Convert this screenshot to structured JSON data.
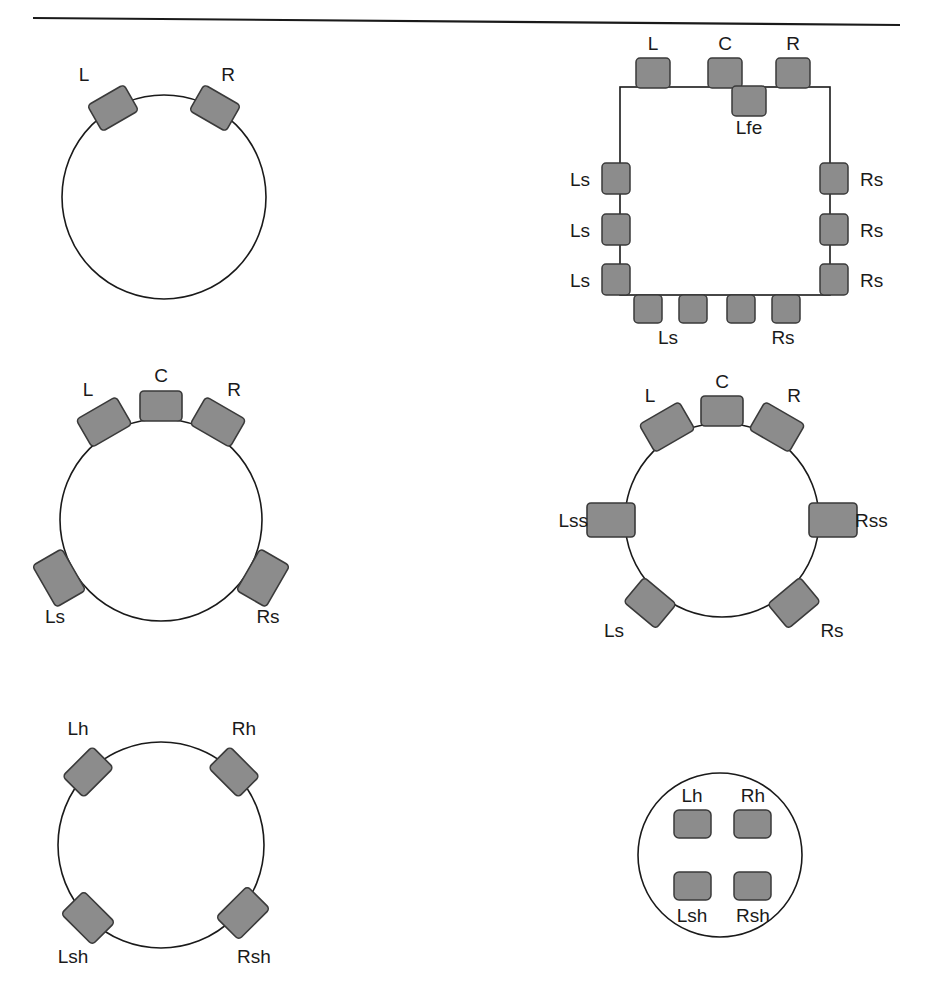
{
  "page": {
    "top_rule": true,
    "background_color": "#ffffff",
    "ink_color": "#1a1a1a",
    "speaker_fill": "#8c8c8c",
    "speaker_stroke": "#3a3a3a"
  },
  "figures": [
    {
      "id": "fig-2-0",
      "name": "two-channel-stereo",
      "shape": "circle",
      "center": [
        164,
        197
      ],
      "radius": 102,
      "speakers": [
        {
          "label": "L",
          "angle": -30,
          "placement": "outside",
          "label_pos": "above"
        },
        {
          "label": "R",
          "angle": 30,
          "placement": "outside",
          "label_pos": "above"
        }
      ]
    },
    {
      "id": "fig-square",
      "name": "large-room-square-layout",
      "shape": "square",
      "rect": [
        620,
        87,
        210,
        208
      ],
      "speakers": [
        {
          "label": "L",
          "edge": "top",
          "pos": 0.18,
          "label_pos": "above"
        },
        {
          "label": "C",
          "edge": "top",
          "pos": 0.5,
          "label_pos": "above"
        },
        {
          "label": "R",
          "edge": "top",
          "pos": 0.82,
          "label_pos": "above"
        },
        {
          "label": "Lfe",
          "edge": "top-inner",
          "pos": 0.62,
          "label_pos": "below"
        },
        {
          "label": "Ls",
          "edge": "left",
          "pos": 0.37,
          "label_pos": "left"
        },
        {
          "label": "Ls",
          "edge": "left",
          "pos": 0.62,
          "label_pos": "left"
        },
        {
          "label": "Ls",
          "edge": "left",
          "pos": 0.86,
          "label_pos": "left"
        },
        {
          "label": "Rs",
          "edge": "right",
          "pos": 0.37,
          "label_pos": "right"
        },
        {
          "label": "Rs",
          "edge": "right",
          "pos": 0.62,
          "label_pos": "right"
        },
        {
          "label": "Rs",
          "edge": "right",
          "pos": 0.86,
          "label_pos": "right"
        },
        {
          "label": "Ls",
          "edge": "bottom",
          "pos": 0.17,
          "label_pos": "none"
        },
        {
          "label": "Ls",
          "edge": "bottom",
          "pos": 0.39,
          "label_pos": "below-pair"
        },
        {
          "label": "Rs",
          "edge": "bottom",
          "pos": 0.61,
          "label_pos": "none"
        },
        {
          "label": "Rs",
          "edge": "bottom",
          "pos": 0.83,
          "label_pos": "below-pair"
        }
      ],
      "bottom_labels": [
        {
          "text": "Ls",
          "x": 668,
          "y": 340
        },
        {
          "text": "Rs",
          "x": 783,
          "y": 340
        }
      ]
    },
    {
      "id": "fig-5-1",
      "name": "five-channel-surround",
      "shape": "circle",
      "center": [
        161,
        520
      ],
      "radius": 101,
      "speakers": [
        {
          "label": "C",
          "angle": 0,
          "placement": "outside",
          "label_pos": "above"
        },
        {
          "label": "L",
          "angle": -30,
          "placement": "outside",
          "label_pos": "above"
        },
        {
          "label": "R",
          "angle": 30,
          "placement": "outside",
          "label_pos": "above"
        },
        {
          "label": "Ls",
          "angle": -120,
          "placement": "outside",
          "label_pos": "below"
        },
        {
          "label": "Rs",
          "angle": 120,
          "placement": "outside",
          "label_pos": "below"
        }
      ]
    },
    {
      "id": "fig-7-1",
      "name": "seven-channel-surround",
      "shape": "circle",
      "center": [
        722,
        520
      ],
      "radius": 97,
      "speakers": [
        {
          "label": "C",
          "angle": 0,
          "placement": "outside",
          "label_pos": "above"
        },
        {
          "label": "L",
          "angle": -30,
          "placement": "outside",
          "label_pos": "above"
        },
        {
          "label": "R",
          "angle": 30,
          "placement": "outside",
          "label_pos": "above"
        },
        {
          "label": "Lss",
          "angle": -90,
          "placement": "outside",
          "label_pos": "left"
        },
        {
          "label": "Rss",
          "angle": 90,
          "placement": "outside",
          "label_pos": "right"
        },
        {
          "label": "Ls",
          "angle": -140,
          "placement": "outside",
          "label_pos": "below"
        },
        {
          "label": "Rs",
          "angle": 140,
          "placement": "outside",
          "label_pos": "below"
        }
      ]
    },
    {
      "id": "fig-height",
      "name": "four-channel-height-layer",
      "shape": "circle",
      "center": [
        161,
        845
      ],
      "radius": 103,
      "speakers": [
        {
          "label": "Lh",
          "angle": -45,
          "placement": "outside",
          "label_pos": "above"
        },
        {
          "label": "Rh",
          "angle": 45,
          "placement": "outside",
          "label_pos": "above"
        },
        {
          "label": "Lsh",
          "angle": -135,
          "placement": "outside",
          "label_pos": "below"
        },
        {
          "label": "Rsh",
          "angle": 135,
          "placement": "outside",
          "label_pos": "below"
        }
      ]
    },
    {
      "id": "fig-overhead",
      "name": "four-channel-overhead-layer",
      "shape": "circle",
      "center": [
        720,
        855
      ],
      "radius": 82,
      "inner_speakers": [
        {
          "label": "Lh",
          "x": 692,
          "y": 824,
          "label_pos": "above"
        },
        {
          "label": "Rh",
          "x": 752,
          "y": 824,
          "label_pos": "above"
        },
        {
          "label": "Lsh",
          "x": 692,
          "y": 884,
          "label_pos": "below"
        },
        {
          "label": "Rsh",
          "x": 752,
          "y": 884,
          "label_pos": "below"
        }
      ]
    }
  ]
}
